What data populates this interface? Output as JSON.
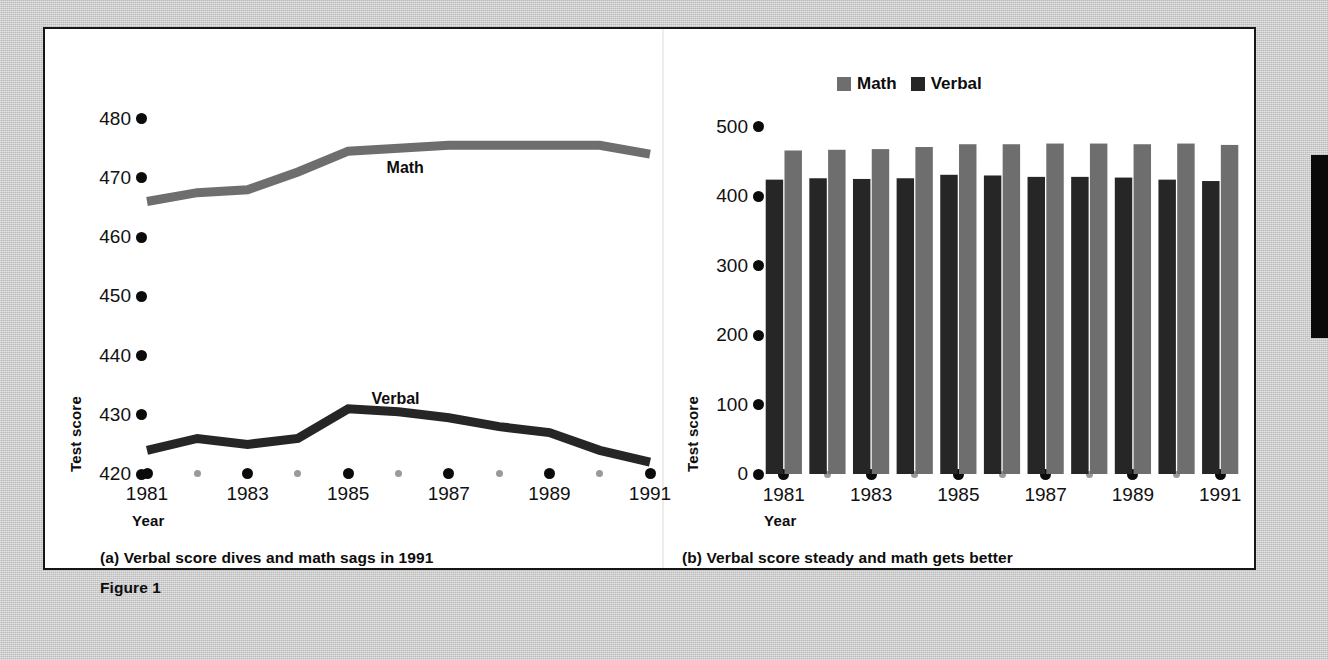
{
  "figure": {
    "label": "Figure 1",
    "caption_a": "(a) Verbal score dives and math sags in 1991",
    "caption_b": "(b) Verbal score steady and math gets better"
  },
  "colors": {
    "math": "#6e6e6e",
    "verbal": "#262626",
    "ink": "#0d0d0d",
    "tick_major": "#0b0b0b",
    "tick_minor": "#9a9a9a",
    "panel_bg": "#ffffff",
    "page_bg": "#c9c9c9",
    "panel_border": "#161616"
  },
  "chart_data": [
    {
      "id": "chart-a",
      "type": "line",
      "title": "(a) Verbal score dives and math sags in 1991",
      "xlabel": "Year",
      "ylabel": "Test score",
      "ylim": [
        420,
        485
      ],
      "yticks": [
        480,
        470,
        460,
        450,
        440,
        430,
        420
      ],
      "xlim": [
        1981,
        1991
      ],
      "x": [
        1981,
        1982,
        1983,
        1984,
        1985,
        1986,
        1987,
        1988,
        1989,
        1990,
        1991
      ],
      "xticks_major": [
        1981,
        1983,
        1985,
        1987,
        1989,
        1991
      ],
      "xticks_minor": [
        1982,
        1984,
        1986,
        1988,
        1990
      ],
      "xticklabels": [
        "1981",
        "1983",
        "1985",
        "1987",
        "1989",
        "1991"
      ],
      "grid": false,
      "legend": "inline-labels",
      "series": [
        {
          "name": "Math",
          "color": "#6e6e6e",
          "values": [
            466,
            467.5,
            468,
            471,
            474.5,
            475,
            475.5,
            475.5,
            475.5,
            475.5,
            474
          ]
        },
        {
          "name": "Verbal",
          "color": "#262626",
          "values": [
            424,
            426,
            425,
            426,
            431,
            430.5,
            429.5,
            428,
            427,
            424,
            422
          ]
        }
      ],
      "annotations": [
        {
          "text": "Math",
          "x": 1986.2,
          "y": 471.5
        },
        {
          "text": "Verbal",
          "x": 1985.9,
          "y": 432.5
        }
      ]
    },
    {
      "id": "chart-b",
      "type": "bar",
      "title": "(b) Verbal score steady and math gets better",
      "xlabel": "Year",
      "ylabel": "Test score",
      "ylim": [
        0,
        520
      ],
      "yticks": [
        500,
        400,
        300,
        200,
        100,
        0
      ],
      "categories": [
        "1981",
        "1982",
        "1983",
        "1984",
        "1985",
        "1986",
        "1987",
        "1988",
        "1989",
        "1990",
        "1991"
      ],
      "xticks_major": [
        "1981",
        "1983",
        "1985",
        "1987",
        "1989",
        "1991"
      ],
      "xticks_minor": [
        "1982",
        "1984",
        "1986",
        "1988",
        "1990"
      ],
      "xticklabels": [
        "1981",
        "1983",
        "1985",
        "1987",
        "1989",
        "1991"
      ],
      "grid": false,
      "legend_position": "top-left",
      "legend_order": [
        "Math",
        "Verbal"
      ],
      "bar_draw_order": [
        "Verbal",
        "Math"
      ],
      "series": [
        {
          "name": "Verbal",
          "color": "#262626",
          "values": [
            424,
            426,
            425,
            426,
            431,
            430,
            428,
            428,
            427,
            424,
            422
          ]
        },
        {
          "name": "Math",
          "color": "#6e6e6e",
          "values": [
            466,
            467,
            468,
            471,
            475,
            475,
            476,
            476,
            475,
            476,
            474
          ]
        }
      ]
    }
  ]
}
